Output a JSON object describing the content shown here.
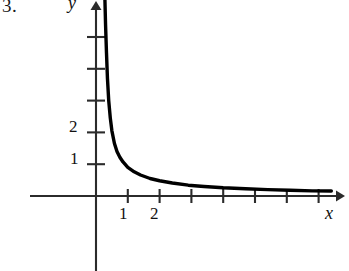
{
  "figure": {
    "problem_number": "3.",
    "axes": {
      "y_axis_label": "y",
      "x_axis_label": "x",
      "y_tick_labels": [
        "2",
        "1"
      ],
      "x_tick_labels": [
        "1",
        "2"
      ]
    },
    "colors": {
      "background": "#ffffff",
      "axis": "#2b2b2b",
      "curve": "#000000",
      "text": "#121212"
    }
  },
  "chart_data": {
    "type": "line",
    "title": "",
    "xlabel": "x",
    "ylabel": "y",
    "xlim": [
      -2.1,
      8.0
    ],
    "ylim": [
      -1.0,
      6.2
    ],
    "grid": false,
    "legend": null,
    "x_ticks": [
      1,
      2,
      3,
      4,
      5,
      6,
      7
    ],
    "x_tick_labels": [
      "1",
      "2",
      "",
      "",
      "",
      "",
      ""
    ],
    "y_ticks": [
      1,
      2,
      3,
      4,
      5
    ],
    "y_tick_labels": [
      "1",
      "2",
      "",
      "",
      ""
    ],
    "annotations": [],
    "series": [
      {
        "name": "y = 1/(x - 0.25)",
        "x": [
          0.28,
          0.3,
          0.33,
          0.36,
          0.4,
          0.45,
          0.5,
          0.58,
          0.66,
          0.75,
          0.85,
          1.0,
          1.2,
          1.4,
          1.7,
          2.0,
          2.4,
          2.9,
          3.4,
          4.0,
          4.7,
          5.4,
          6.1,
          6.8,
          7.4
        ],
        "y": [
          6.2,
          5.4,
          4.5,
          3.7,
          3.0,
          2.45,
          2.05,
          1.65,
          1.4,
          1.22,
          1.07,
          0.9,
          0.76,
          0.66,
          0.55,
          0.48,
          0.41,
          0.34,
          0.3,
          0.26,
          0.23,
          0.2,
          0.18,
          0.16,
          0.155
        ]
      }
    ]
  }
}
